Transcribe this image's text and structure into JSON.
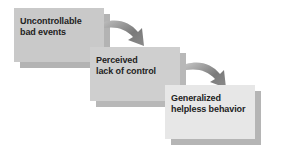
{
  "diagram": {
    "type": "flow",
    "direction": "top-left to bottom-right",
    "nodes": [
      {
        "id": "n1",
        "lines": [
          "Uncontrollable",
          "bad events"
        ],
        "fill": "#c9c9c9"
      },
      {
        "id": "n2",
        "lines": [
          "Perceived",
          "lack of control"
        ],
        "fill": "#cfcfcf"
      },
      {
        "id": "n3",
        "lines": [
          "Generalized",
          "helpless behavior"
        ],
        "fill": "#e7e7e7"
      }
    ],
    "edges": [
      {
        "from": "n1",
        "to": "n2",
        "style": "curved-arrow"
      },
      {
        "from": "n2",
        "to": "n3",
        "style": "curved-arrow"
      }
    ],
    "colors": {
      "shadow": "#b5b5b5",
      "arrow_dark": "#6e6e6e",
      "arrow_light": "#bdbdbd",
      "text": "#222222"
    }
  }
}
